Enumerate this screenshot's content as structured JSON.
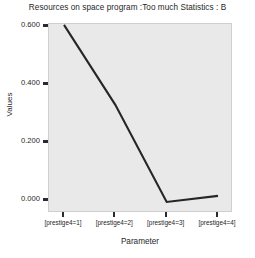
{
  "chart_data": {
    "type": "line",
    "title": "Resources on space program :Too much Statistics : B",
    "xlabel": "Parameter",
    "ylabel": "Values",
    "categories": [
      "[prestige4=1]",
      "[prestige4=2]",
      "[prestige4=3]",
      "[prestige4=4]"
    ],
    "values": [
      0.607,
      0.331,
      -0.004,
      0.017
    ],
    "series": [
      {
        "name": "Values",
        "values": [
          0.607,
          0.331,
          -0.004,
          0.017
        ]
      }
    ],
    "ylim": [
      -0.042,
      0.61
    ],
    "yticks": [
      0.0,
      0.2,
      0.4,
      0.6
    ],
    "ytick_labels": [
      "0.000",
      "0.200",
      "0.400",
      "0.600"
    ],
    "grid": false,
    "legend": "none",
    "line_color": "#262626",
    "plot_background": "#e9e9e9",
    "figure_background": "#ffffff"
  },
  "axes": {
    "y_ticks": [
      {
        "label": "0.600",
        "value": 0.6
      },
      {
        "label": "0.400",
        "value": 0.4
      },
      {
        "label": "0.200",
        "value": 0.2
      },
      {
        "label": "0.000",
        "value": 0.0
      }
    ],
    "x_ticks": [
      {
        "label": "[prestige4=1]"
      },
      {
        "label": "[prestige4=2]"
      },
      {
        "label": "[prestige4=3]"
      },
      {
        "label": "[prestige4=4]"
      }
    ]
  }
}
